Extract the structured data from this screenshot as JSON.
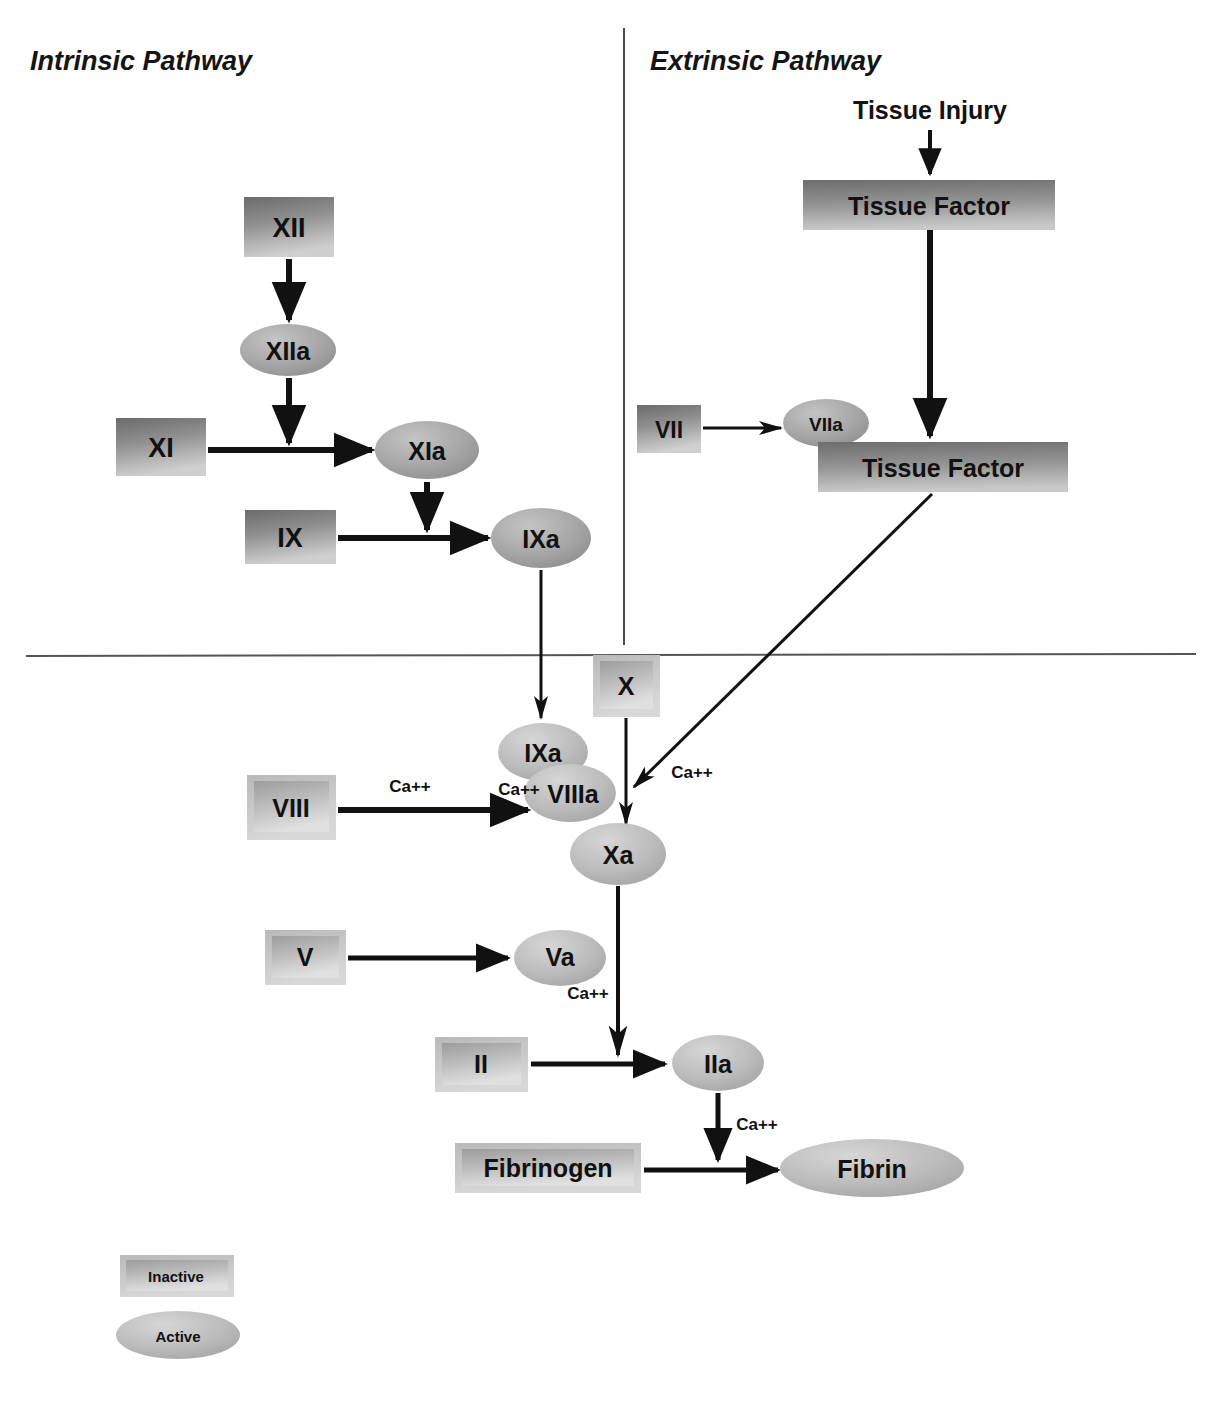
{
  "diagram": {
    "sections": [
      {
        "id": "intrinsic",
        "label": "Intrinsic Pathway"
      },
      {
        "id": "extrinsic",
        "label": "Extrinsic Pathway"
      }
    ],
    "stimulus": {
      "id": "tissue-injury",
      "label": "Tissue Injury"
    },
    "inactive_factors": [
      {
        "id": "xii",
        "label": "XII",
        "x": 244,
        "y": 197,
        "w": 90,
        "h": 60,
        "font": 27,
        "style": "flat"
      },
      {
        "id": "xi",
        "label": "XI",
        "x": 116,
        "y": 418,
        "w": 90,
        "h": 58,
        "font": 27,
        "style": "flat"
      },
      {
        "id": "ix",
        "label": "IX",
        "x": 245,
        "y": 510,
        "w": 91,
        "h": 54,
        "font": 27,
        "style": "flat"
      },
      {
        "id": "vii",
        "label": "VII",
        "x": 637,
        "y": 405,
        "w": 64,
        "h": 48,
        "font": 23,
        "style": "flat"
      },
      {
        "id": "tf-1",
        "label": "Tissue Factor",
        "x": 803,
        "y": 180,
        "w": 252,
        "h": 50,
        "font": 25,
        "style": "flat"
      },
      {
        "id": "tf-2",
        "label": "Tissue Factor",
        "x": 818,
        "y": 442,
        "w": 250,
        "h": 50,
        "font": 25,
        "style": "flat"
      },
      {
        "id": "x",
        "label": "X",
        "x": 593,
        "y": 655,
        "w": 67,
        "h": 62,
        "font": 25,
        "style": "bevel"
      },
      {
        "id": "viii",
        "label": "VIII",
        "x": 247,
        "y": 775,
        "w": 89,
        "h": 65,
        "font": 25,
        "style": "bevel"
      },
      {
        "id": "v",
        "label": "V",
        "x": 265,
        "y": 930,
        "w": 81,
        "h": 55,
        "font": 25,
        "style": "bevel"
      },
      {
        "id": "ii",
        "label": "II",
        "x": 435,
        "y": 1037,
        "w": 93,
        "h": 55,
        "font": 25,
        "style": "bevel"
      },
      {
        "id": "fibrinogen",
        "label": "Fibrinogen",
        "x": 455,
        "y": 1143,
        "w": 186,
        "h": 50,
        "font": 25,
        "style": "bevel"
      }
    ],
    "active_factors": [
      {
        "id": "xiia",
        "label": "XIIa",
        "cx": 288,
        "cy": 350,
        "rx": 48,
        "ry": 26,
        "font": 25
      },
      {
        "id": "xia",
        "label": "XIa",
        "cx": 427,
        "cy": 450,
        "rx": 52,
        "ry": 29,
        "font": 25
      },
      {
        "id": "ixa",
        "label": "IXa",
        "cx": 541,
        "cy": 538,
        "rx": 50,
        "ry": 30,
        "font": 25
      },
      {
        "id": "viia",
        "label": "VIIa",
        "cx": 826,
        "cy": 423,
        "rx": 43,
        "ry": 24,
        "font": 19
      },
      {
        "id": "ixa-2",
        "label": "IXa",
        "cx": 543,
        "cy": 752,
        "rx": 45,
        "ry": 29,
        "font": 25
      },
      {
        "id": "viiia",
        "label": "VIIIa",
        "cx": 570,
        "cy": 793,
        "rx": 46,
        "ry": 29,
        "font": 25
      },
      {
        "id": "xa",
        "label": "Xa",
        "cx": 618,
        "cy": 854,
        "rx": 48,
        "ry": 31,
        "font": 25
      },
      {
        "id": "va",
        "label": "Va",
        "cx": 560,
        "cy": 958,
        "rx": 46,
        "ry": 28,
        "font": 25
      },
      {
        "id": "iia",
        "label": "IIa",
        "cx": 718,
        "cy": 1063,
        "rx": 46,
        "ry": 28,
        "font": 25
      },
      {
        "id": "fibrin",
        "label": "Fibrin",
        "cx": 872,
        "cy": 1168,
        "rx": 92,
        "ry": 29,
        "font": 25
      }
    ],
    "cofactor_labels": [
      {
        "id": "ca-viii",
        "label": "Ca++",
        "x": 410,
        "y": 786
      },
      {
        "id": "ca-viiia",
        "label": "Ca++",
        "x": 519,
        "y": 789
      },
      {
        "id": "ca-xa",
        "label": "Ca++",
        "x": 692,
        "y": 772
      },
      {
        "id": "ca-va",
        "label": "Ca++",
        "x": 588,
        "y": 993
      },
      {
        "id": "ca-iia",
        "label": "Ca++",
        "x": 757,
        "y": 1124
      }
    ],
    "legend": {
      "items": [
        {
          "id": "legend-inactive",
          "label": "Inactive",
          "shape": "rectangle"
        },
        {
          "id": "legend-active",
          "label": "Active",
          "shape": "ellipse"
        }
      ]
    },
    "colors": {
      "fill_dark": "#6f6f6f",
      "fill_mid": "#9a9a9a",
      "fill_light": "#d2d2d2",
      "stroke": "#111111",
      "divider": "#4a4a4a",
      "background": "#ffffff"
    }
  }
}
